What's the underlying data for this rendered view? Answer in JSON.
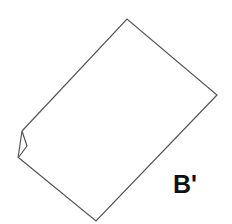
{
  "diagram": {
    "label": "B'",
    "stroke_color": "#555555",
    "shape": "rotated-rectangle-with-folded-corner"
  }
}
